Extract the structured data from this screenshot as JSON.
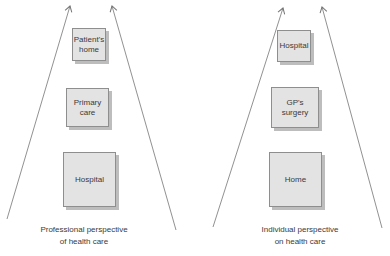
{
  "figure": {
    "left_diagram": {
      "caption": "Professional perspective\nof health care",
      "boxes": [
        {
          "label": "Patient's\nhome"
        },
        {
          "label": "Primary\ncare"
        },
        {
          "label": "Hospital"
        }
      ]
    },
    "right_diagram": {
      "caption": "Individual perspective\non health care",
      "boxes": [
        {
          "label": "Hospital"
        },
        {
          "label": "GP's\nsurgery"
        },
        {
          "label": "Home"
        }
      ]
    },
    "icons": {
      "arrows": "up-arrow-icon"
    },
    "colors": {
      "box_fill": "#e3e3e3",
      "box_border": "#8e8e8e",
      "box_shadow": "#bdbdbd",
      "arrow": "#757575",
      "text": "#3a3a3a",
      "background": "#ffffff"
    }
  }
}
